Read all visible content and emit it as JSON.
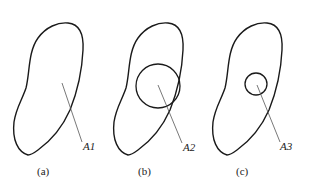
{
  "figure": {
    "panels": [
      {
        "id": "a",
        "caption": "(a)",
        "callout": "A1",
        "inner_circle": null
      },
      {
        "id": "b",
        "caption": "(b)",
        "callout": "A2",
        "inner_circle": {
          "r": 22
        }
      },
      {
        "id": "c",
        "caption": "(c)",
        "callout": "A3",
        "inner_circle": {
          "r": 11
        }
      }
    ],
    "stroke_color": "#1a1a1a",
    "leader_color": "#555555"
  }
}
